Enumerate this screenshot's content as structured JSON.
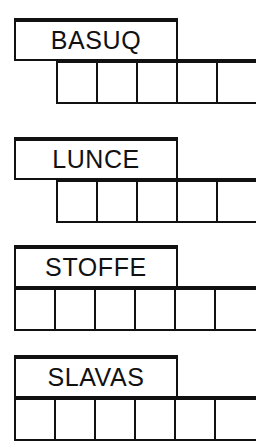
{
  "sheet": {
    "title": "Word puzzle worksheet",
    "background_color": "#ffffff",
    "ink_color": "#111111",
    "width": 275,
    "height": 447
  },
  "puzzle_rows": [
    {
      "id": "row-1",
      "word": "BASUQ",
      "word_box": {
        "left": 14,
        "top": 18,
        "width": 164,
        "height": 43
      },
      "grid": {
        "left": 56,
        "top": 59,
        "width": 200,
        "height": 45,
        "cell_count": 5,
        "cell_width": 40
      },
      "cells": [
        {
          "index": 1,
          "letter": "",
          "circled": true
        },
        {
          "index": 2,
          "letter": "",
          "circled": false
        },
        {
          "index": 3,
          "letter": "",
          "circled": false
        },
        {
          "index": 4,
          "letter": "",
          "circled": false
        },
        {
          "index": 5,
          "letter": "",
          "circled": false
        }
      ],
      "circled_positions": [
        1
      ]
    },
    {
      "id": "row-2",
      "word": "LUNCE",
      "word_box": {
        "left": 14,
        "top": 137,
        "width": 164,
        "height": 43
      },
      "grid": {
        "left": 56,
        "top": 178,
        "width": 200,
        "height": 45,
        "cell_count": 5,
        "cell_width": 40
      },
      "cells": [
        {
          "index": 1,
          "letter": "",
          "circled": true
        },
        {
          "index": 2,
          "letter": "",
          "circled": false
        },
        {
          "index": 3,
          "letter": "",
          "circled": false
        },
        {
          "index": 4,
          "letter": "",
          "circled": false
        },
        {
          "index": 5,
          "letter": "",
          "circled": true
        }
      ],
      "circled_positions": [
        1,
        5
      ]
    },
    {
      "id": "row-3",
      "word": "STOFFE",
      "word_box": {
        "left": 14,
        "top": 245,
        "width": 164,
        "height": 43
      },
      "grid": {
        "left": 14,
        "top": 286,
        "width": 242,
        "height": 45,
        "cell_count": 6,
        "cell_width": 40
      },
      "cells": [
        {
          "index": 1,
          "letter": "",
          "circled": false
        },
        {
          "index": 2,
          "letter": "",
          "circled": false
        },
        {
          "index": 3,
          "letter": "",
          "circled": false
        },
        {
          "index": 4,
          "letter": "",
          "circled": true
        },
        {
          "index": 5,
          "letter": "",
          "circled": true
        },
        {
          "index": 6,
          "letter": "",
          "circled": false
        }
      ],
      "circled_positions": [
        4,
        5
      ]
    },
    {
      "id": "row-4",
      "word": "SLAVAS",
      "word_box": {
        "left": 14,
        "top": 355,
        "width": 164,
        "height": 43
      },
      "grid": {
        "left": 14,
        "top": 396,
        "width": 242,
        "height": 45,
        "cell_count": 6,
        "cell_width": 40
      },
      "cells": [
        {
          "index": 1,
          "letter": "",
          "circled": false
        },
        {
          "index": 2,
          "letter": "",
          "circled": false
        },
        {
          "index": 3,
          "letter": "",
          "circled": true
        },
        {
          "index": 4,
          "letter": "",
          "circled": false
        },
        {
          "index": 5,
          "letter": "",
          "circled": false
        },
        {
          "index": 6,
          "letter": "",
          "circled": true
        }
      ],
      "circled_positions": [
        3,
        6
      ]
    }
  ]
}
